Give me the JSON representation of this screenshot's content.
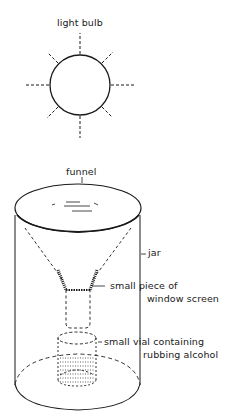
{
  "diagram": {
    "labels": {
      "light_bulb": "light bulb",
      "funnel": "funnel",
      "jar": "jar",
      "screen_line1": "small piece of",
      "screen_line2": "window screen",
      "vial_line1": "small vial containing",
      "vial_line2": "rubbing alcohol"
    },
    "components": [
      {
        "id": "light-bulb",
        "shape": "circle with 8 dashed light rays"
      },
      {
        "id": "funnel",
        "shape": "ellipse rim with dashed cone"
      },
      {
        "id": "jar",
        "shape": "cylinder"
      },
      {
        "id": "window-screen",
        "shape": "hatched mesh at funnel neck"
      },
      {
        "id": "vial",
        "shape": "dashed cylinder with stippled liquid"
      }
    ],
    "colors": {
      "ink": "#1a1a1a",
      "background": "#ffffff"
    }
  }
}
